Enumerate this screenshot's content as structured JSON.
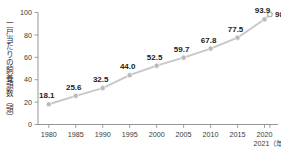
{
  "chart_data": {
    "type": "line",
    "title": "",
    "xlabel": "年",
    "ylabel": "一戸当たりの飼養頭数（頭）",
    "x": [
      1980,
      1985,
      1990,
      1995,
      2000,
      2005,
      2010,
      2015,
      2020,
      2021
    ],
    "categories": [
      "1980",
      "1985",
      "1990",
      "1995",
      "2000",
      "2005",
      "2010",
      "2015",
      "2020",
      "2021"
    ],
    "values": [
      18.1,
      25.6,
      32.5,
      44.0,
      52.5,
      59.7,
      67.8,
      77.5,
      93.9,
      98.3
    ],
    "point_labels": [
      "18.1",
      "25.6",
      "32.5",
      "44.0",
      "52.5",
      "59.7",
      "67.8",
      "77.5",
      "93.9",
      "98.3"
    ],
    "xtick_labels": [
      "1980",
      "1985",
      "1990",
      "1995",
      "2000",
      "2005",
      "2010",
      "2015",
      "2020"
    ],
    "xtick_extra_label": "2021（年）",
    "ytick_labels": [
      "0",
      "20",
      "40",
      "60",
      "80",
      "100"
    ],
    "ytick_values": [
      0,
      20,
      40,
      60,
      80,
      100
    ],
    "ylim": [
      0,
      100
    ],
    "xlim": [
      1978,
      2022.5
    ],
    "grid": false,
    "legend": "none",
    "colors": {
      "line": "#c7c7c7",
      "marker": "#b9b9b9",
      "marker_last_fill": "#ffffff",
      "axis": "#8a8a8a",
      "label_text": "#222222",
      "tick_text": "#3a3a3a",
      "background": "#ffffff"
    }
  },
  "axis": {
    "y_title": "一戸当たりの飼養頭数（頭）",
    "x_year_suffix": "2021（年）"
  }
}
